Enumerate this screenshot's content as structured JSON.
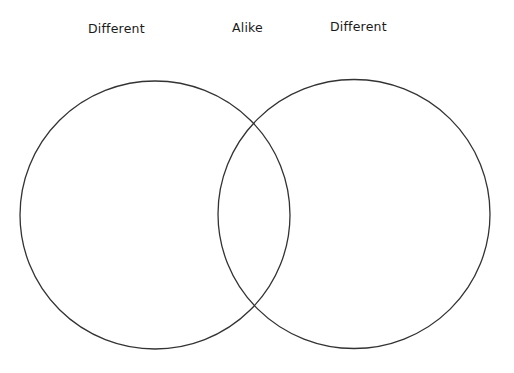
{
  "diagram": {
    "type": "venn",
    "labels": {
      "left": "Different",
      "middle": "Alike",
      "right": "Different"
    },
    "circles": [
      {
        "name": "left",
        "cx": 155,
        "cy": 215,
        "rx": 135,
        "ry": 134
      },
      {
        "name": "right",
        "cx": 354,
        "cy": 214,
        "rx": 136,
        "ry": 134.5
      }
    ],
    "stroke_color": "#333333",
    "background_color": "#ffffff"
  }
}
